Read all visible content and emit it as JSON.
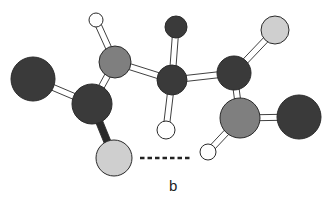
{
  "figure": {
    "label": "b",
    "type": "ball-and-stick molecular model",
    "colors": {
      "dark_atom": "#3a3a3a",
      "medium_atom": "#7f7f7f",
      "light_atom": "#cfcfcf",
      "hydrogen": "#ffffff",
      "outline": "#2a2a2a",
      "bond_fill": "#ffffff",
      "dark_bond": "#2a2a2a",
      "hbond": "#222222"
    },
    "atoms": [
      {
        "id": "dark-large-left",
        "cx": 33,
        "cy": 79,
        "r": 22,
        "shade": "dark"
      },
      {
        "id": "dark-carbon-left",
        "cx": 92,
        "cy": 104,
        "r": 20,
        "shade": "dark"
      },
      {
        "id": "gray-nitrogen-left",
        "cx": 115,
        "cy": 62,
        "r": 16,
        "shade": "medium"
      },
      {
        "id": "hydrogen-top-left",
        "cx": 96,
        "cy": 20,
        "r": 7,
        "shade": "hydrogen"
      },
      {
        "id": "light-oxygen-left",
        "cx": 114,
        "cy": 158,
        "r": 18,
        "shade": "light"
      },
      {
        "id": "dark-carbon-center",
        "cx": 172,
        "cy": 80,
        "r": 15,
        "shade": "dark"
      },
      {
        "id": "dark-small-top",
        "cx": 176,
        "cy": 27,
        "r": 11,
        "shade": "dark"
      },
      {
        "id": "hydrogen-center",
        "cx": 166,
        "cy": 130,
        "r": 9,
        "shade": "hydrogen"
      },
      {
        "id": "dark-carbon-right",
        "cx": 234,
        "cy": 73,
        "r": 17,
        "shade": "dark"
      },
      {
        "id": "light-oxygen-top-right",
        "cx": 275,
        "cy": 30,
        "r": 14,
        "shade": "light"
      },
      {
        "id": "gray-nitrogen-right",
        "cx": 240,
        "cy": 118,
        "r": 20,
        "shade": "medium"
      },
      {
        "id": "hydrogen-bottom-right",
        "cx": 208,
        "cy": 152,
        "r": 8,
        "shade": "hydrogen"
      },
      {
        "id": "dark-large-right",
        "cx": 299,
        "cy": 117,
        "r": 22,
        "shade": "dark"
      }
    ],
    "bonds": [
      {
        "from": "dark-large-left",
        "to": "dark-carbon-left",
        "style": "open"
      },
      {
        "from": "dark-carbon-left",
        "to": "gray-nitrogen-left",
        "style": "open"
      },
      {
        "from": "dark-carbon-left",
        "to": "light-oxygen-left",
        "style": "solid"
      },
      {
        "from": "gray-nitrogen-left",
        "to": "hydrogen-top-left",
        "style": "open"
      },
      {
        "from": "gray-nitrogen-left",
        "to": "dark-carbon-center",
        "style": "open"
      },
      {
        "from": "dark-carbon-center",
        "to": "dark-small-top",
        "style": "open"
      },
      {
        "from": "dark-carbon-center",
        "to": "hydrogen-center",
        "style": "open"
      },
      {
        "from": "dark-carbon-center",
        "to": "dark-carbon-right",
        "style": "open"
      },
      {
        "from": "dark-carbon-right",
        "to": "light-oxygen-top-right",
        "style": "open"
      },
      {
        "from": "dark-carbon-right",
        "to": "gray-nitrogen-right",
        "style": "open"
      },
      {
        "from": "gray-nitrogen-right",
        "to": "hydrogen-bottom-right",
        "style": "open"
      },
      {
        "from": "gray-nitrogen-right",
        "to": "dark-large-right",
        "style": "open"
      }
    ],
    "hydrogen_bond": {
      "x1": 140,
      "y1": 158,
      "x2": 190,
      "y2": 158
    }
  }
}
